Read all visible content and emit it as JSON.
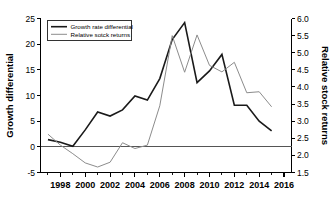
{
  "chart_data": {
    "type": "line",
    "title": "",
    "xlabel": "",
    "grid": false,
    "legend_position": "top-left",
    "x": [
      1997,
      1998,
      1999,
      2000,
      2001,
      2002,
      2003,
      2004,
      2005,
      2006,
      2007,
      2008,
      2009,
      2010,
      2011,
      2012,
      2013,
      2014,
      2015
    ],
    "xlim": [
      1996.4,
      2016.6
    ],
    "xticks_major": [
      1998,
      2000,
      2002,
      2004,
      2006,
      2008,
      2010,
      2012,
      2014,
      2016
    ],
    "xticks_minor": [
      1997,
      1999,
      2001,
      2003,
      2005,
      2007,
      2009,
      2011,
      2013,
      2015
    ],
    "xtick_labels": [
      "1998",
      "2000",
      "2002",
      "2004",
      "2006",
      "2008",
      "2010",
      "2012",
      "2014",
      "2016"
    ],
    "left_axis": {
      "label": "Growth differential",
      "ylim": [
        -5,
        25
      ],
      "ticks": [
        -5,
        0,
        5,
        10,
        15,
        20,
        25
      ],
      "tick_labels": [
        "-5",
        "0",
        "5",
        "10",
        "15",
        "20",
        "25"
      ]
    },
    "right_axis": {
      "label": "Relative stock returns",
      "ylim": [
        1.5,
        6.0
      ],
      "ticks": [
        1.5,
        2.0,
        2.5,
        3.0,
        3.5,
        4.0,
        4.5,
        5.0,
        5.5,
        6.0
      ],
      "tick_labels": [
        "1.5",
        "2.0",
        "2.5",
        "3.0",
        "3.5",
        "4.0",
        "4.5",
        "5.0",
        "5.5",
        "6.0"
      ]
    },
    "series": [
      {
        "name": "Growth rate differential",
        "axis": "left",
        "color": "#1a1a1a",
        "width": 1.6,
        "values": [
          1.4,
          0.9,
          0.1,
          3.3,
          6.8,
          6.0,
          7.2,
          9.9,
          9.1,
          13.3,
          20.9,
          24.2,
          12.5,
          14.8,
          18.0,
          8.1,
          8.1,
          5.0,
          3.1
        ]
      },
      {
        "name": "Relative sotck returns",
        "axis": "right",
        "color": "#8c8c8c",
        "width": 1.0,
        "values": [
          2.62,
          2.3,
          2.05,
          1.78,
          1.66,
          1.8,
          2.37,
          2.2,
          2.3,
          3.45,
          5.5,
          4.43,
          5.52,
          4.63,
          4.44,
          4.72,
          3.83,
          3.86,
          3.42
        ]
      }
    ],
    "legend": [
      {
        "label": "Growth rate differential",
        "color": "#1a1a1a",
        "width": 1.6
      },
      {
        "label": "Relative sotck returns",
        "color": "#8c8c8c",
        "width": 1.0
      }
    ],
    "colors": {
      "growth_rate_differential": "#1a1a1a",
      "relative_stock_returns": "#8c8c8c",
      "axis": "#000000",
      "background": "#ffffff"
    }
  }
}
